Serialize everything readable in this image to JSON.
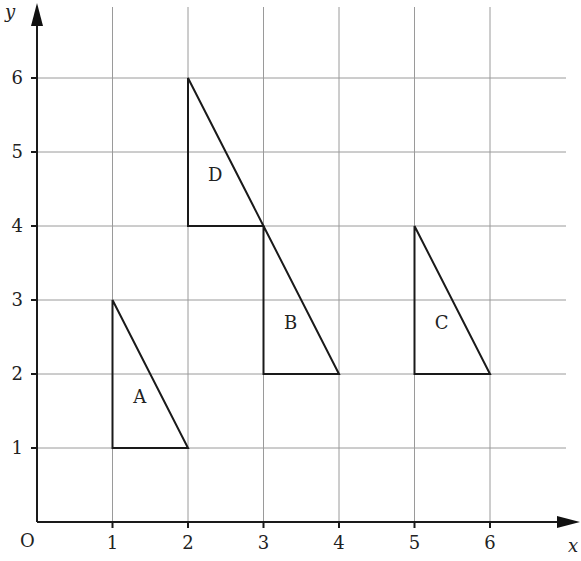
{
  "diagram": {
    "origin_label": "O",
    "x_axis_label": "x",
    "y_axis_label": "y",
    "x_ticks": [
      "1",
      "2",
      "3",
      "4",
      "5",
      "6"
    ],
    "y_ticks": [
      "1",
      "2",
      "3",
      "4",
      "5",
      "6"
    ],
    "shapes": [
      {
        "label": "A",
        "vertices": [
          [
            1,
            3
          ],
          [
            1,
            1
          ],
          [
            2,
            1
          ]
        ]
      },
      {
        "label": "B",
        "vertices": [
          [
            3,
            4
          ],
          [
            3,
            2
          ],
          [
            4,
            2
          ]
        ]
      },
      {
        "label": "C",
        "vertices": [
          [
            5,
            4
          ],
          [
            5,
            2
          ],
          [
            6,
            2
          ]
        ]
      },
      {
        "label": "D",
        "vertices": [
          [
            2,
            6
          ],
          [
            2,
            4
          ],
          [
            3,
            4
          ]
        ]
      }
    ]
  }
}
